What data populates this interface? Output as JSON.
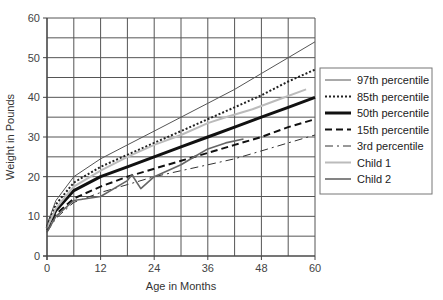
{
  "chart_data": {
    "type": "line",
    "title": "",
    "xlabel": "Age in Months",
    "ylabel": "Weight in Pounds",
    "xlim": [
      0,
      60
    ],
    "ylim": [
      0,
      60
    ],
    "x_ticks": [
      0,
      12,
      24,
      36,
      48,
      60
    ],
    "y_ticks": [
      0,
      10,
      20,
      30,
      40,
      50,
      60
    ],
    "grid": {
      "x_step": 6,
      "y_step": 5,
      "on": true
    },
    "legend_position": "right",
    "series": [
      {
        "name": "97th percentile",
        "style": "thin-solid",
        "color": "#555555",
        "x": [
          0,
          2,
          6,
          12,
          18,
          24,
          30,
          36,
          42,
          48,
          54,
          60
        ],
        "y": [
          8,
          14,
          20,
          24.5,
          28,
          31.5,
          35,
          38.5,
          42,
          46,
          50,
          54
        ]
      },
      {
        "name": "85th percentile",
        "style": "dotted",
        "color": "#222222",
        "x": [
          0,
          2,
          6,
          12,
          18,
          24,
          30,
          36,
          42,
          48,
          54,
          60
        ],
        "y": [
          7.5,
          13,
          18.5,
          22.5,
          25.5,
          28.5,
          31.5,
          34.5,
          37.5,
          40.5,
          44,
          47
        ]
      },
      {
        "name": "50th percentile",
        "style": "thick-solid",
        "color": "#111111",
        "x": [
          0,
          2,
          6,
          12,
          18,
          24,
          30,
          36,
          42,
          48,
          54,
          60
        ],
        "y": [
          7,
          11.5,
          16.5,
          20,
          22.5,
          25,
          27.5,
          30,
          32.5,
          35,
          37.5,
          40
        ]
      },
      {
        "name": "15th percentile",
        "style": "dashed",
        "color": "#111111",
        "x": [
          0,
          2,
          6,
          12,
          18,
          24,
          30,
          36,
          42,
          48,
          54,
          60
        ],
        "y": [
          6.5,
          10.5,
          14.5,
          17.5,
          20,
          22,
          24,
          26,
          28,
          30,
          32.5,
          34.5
        ]
      },
      {
        "name": "3rd percentile",
        "style": "dash-dot",
        "color": "#333333",
        "x": [
          0,
          2,
          6,
          12,
          18,
          24,
          30,
          36,
          42,
          48,
          54,
          60
        ],
        "y": [
          6,
          9.5,
          13.5,
          16,
          18,
          20,
          21.5,
          23,
          24.5,
          26.5,
          28.5,
          30.5
        ]
      },
      {
        "name": "Child 1",
        "style": "light-solid",
        "color": "#bbbbbb",
        "x": [
          0,
          2,
          6,
          12,
          18,
          24,
          30,
          36,
          40,
          46,
          52,
          58
        ],
        "y": [
          7,
          12,
          17.5,
          21.5,
          25,
          28,
          30.5,
          33.5,
          35,
          37,
          39.5,
          42
        ]
      },
      {
        "name": "Child 2",
        "style": "medium-solid",
        "color": "#666666",
        "x": [
          0,
          2,
          6,
          12,
          18,
          19,
          21,
          24,
          27,
          30,
          33,
          36,
          40,
          44
        ],
        "y": [
          6,
          10,
          14,
          15,
          19,
          20.5,
          17,
          20,
          21.5,
          23,
          25,
          27,
          28.5,
          29.5
        ]
      }
    ]
  },
  "axes": {
    "x_title": "Age in Months",
    "y_title": "Weight in Pounds",
    "x_tick_labels": [
      "0",
      "12",
      "24",
      "36",
      "48",
      "60"
    ],
    "y_tick_labels": [
      "0",
      "10",
      "20",
      "30",
      "40",
      "50",
      "60"
    ]
  },
  "legend": {
    "items": [
      {
        "label": "97th percentile"
      },
      {
        "label": "85th percentile"
      },
      {
        "label": "50th percentile"
      },
      {
        "label": "15th percentile"
      },
      {
        "label": "3rd percentile"
      },
      {
        "label": "Child 1"
      },
      {
        "label": "Child 2"
      }
    ]
  }
}
